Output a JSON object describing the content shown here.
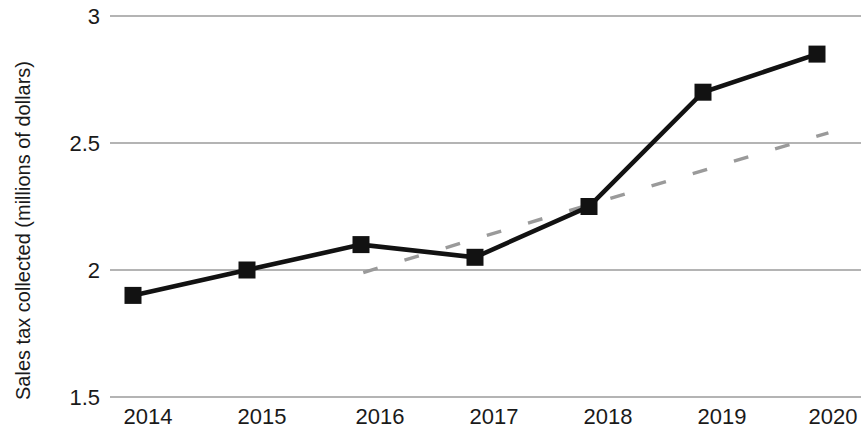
{
  "chart_data": {
    "type": "line",
    "title": "",
    "xlabel": "",
    "ylabel": "Sales tax collected (millions of dollars)",
    "categories": [
      "2014",
      "2015",
      "2016",
      "2017",
      "2018",
      "2019",
      "2020"
    ],
    "x": [
      2014,
      2015,
      2016,
      2017,
      2018,
      2019,
      2020
    ],
    "ylim": [
      1.5,
      3
    ],
    "xlim": [
      2013.7,
      2020.45
    ],
    "y_ticks": [
      "1.5",
      "2",
      "2.5",
      "3"
    ],
    "y_tick_values": [
      1.5,
      2,
      2.5,
      3
    ],
    "grid": "horizontal",
    "legend": "none",
    "series": [
      {
        "name": "Sales tax collected",
        "style": "solid-black-with-square-markers",
        "color": "#121212",
        "markers": true,
        "values": [
          1.9,
          2.0,
          2.1,
          2.05,
          2.25,
          2.7,
          2.85
        ]
      },
      {
        "name": "Trend line",
        "style": "dashed-gray",
        "color": "#9a9a9a",
        "markers": false,
        "x": [
          2016.02,
          2020.1
        ],
        "values": [
          1.99,
          2.54
        ]
      }
    ]
  },
  "axes": {
    "y_label": "Sales tax collected (millions of dollars)",
    "y_tick_3": "3",
    "y_tick_2_5": "2.5",
    "y_tick_2": "2",
    "y_tick_1_5": "1.5",
    "x_tick_2014": "2014",
    "x_tick_2015": "2015",
    "x_tick_2016": "2016",
    "x_tick_2017": "2017",
    "x_tick_2018": "2018",
    "x_tick_2019": "2019",
    "x_tick_2020": "2020"
  },
  "colors": {
    "series_main": "#121212",
    "series_trend": "#9a9a9a",
    "gridline": "#b4b4b4",
    "text": "#1a1a1a",
    "background": "#ffffff"
  }
}
